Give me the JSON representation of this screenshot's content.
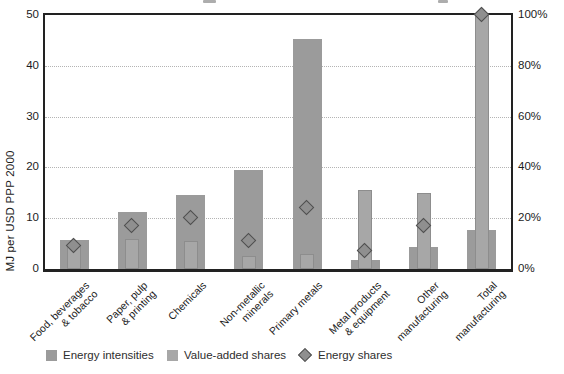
{
  "y_axis_left": {
    "label": "MJ per USD PPP 2000",
    "ticks": [
      "0",
      "10",
      "20",
      "30",
      "40",
      "50"
    ]
  },
  "y_axis_right": {
    "ticks": [
      "0%",
      "20%",
      "40%",
      "60%",
      "80%",
      "100%"
    ]
  },
  "legend": {
    "items": [
      {
        "label": "Energy intensities",
        "swatch": "square",
        "color": "#9b9b9b"
      },
      {
        "label": "Value-added shares",
        "swatch": "square",
        "color": "#a7a7a7"
      },
      {
        "label": "Energy shares",
        "swatch": "diamond",
        "color": "#8f8f8f"
      }
    ]
  },
  "colors": {
    "intensity_bar": "#9b9b9b",
    "value_added_bar": "#a7a7a7",
    "diamond_fill": "#8f8f8f",
    "diamond_border": "#4f4f4f",
    "plot_border": "#222222",
    "gridline": "#b4b4b4"
  },
  "chart_data": {
    "type": "bar",
    "title": "",
    "categories": [
      "Food, beverages & tobacco",
      "Paper, pulp & printing",
      "Chemicals",
      "Non-metallic minerals",
      "Primary metals",
      "Metal products & equipment",
      "Other manufacturing",
      "Total manufacturing"
    ],
    "category_lines": [
      [
        "Food, beverages",
        "& tobacco"
      ],
      [
        "Paper, pulp",
        "& printing"
      ],
      [
        "Chemicals"
      ],
      [
        "Non-metallic",
        "minerals"
      ],
      [
        "Primary metals"
      ],
      [
        "Metal products",
        "& equipment"
      ],
      [
        "Other",
        "manufacturing"
      ],
      [
        "Total",
        "manufacturing"
      ]
    ],
    "series": [
      {
        "name": "Energy intensities",
        "axis": "left",
        "mark": "wide-bar",
        "values": [
          5.8,
          11.3,
          14.5,
          19.5,
          45.3,
          1.7,
          4.3,
          7.7
        ]
      },
      {
        "name": "Value-added shares",
        "axis": "right",
        "mark": "narrow-bar",
        "values": [
          9,
          12,
          11,
          5,
          6,
          31,
          30,
          100
        ]
      },
      {
        "name": "Energy shares",
        "axis": "right",
        "mark": "diamond",
        "values": [
          9,
          17,
          20,
          11,
          24,
          7,
          17,
          100
        ]
      }
    ],
    "ylabel_left": "MJ per USD PPP 2000",
    "ylabel_right": "",
    "ylim_left": [
      0,
      50
    ],
    "ylim_right": [
      0,
      100
    ],
    "grid": "horizontal-dotted",
    "legend_position": "bottom"
  }
}
